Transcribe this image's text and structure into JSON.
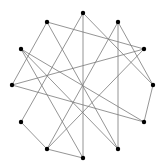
{
  "diagram": {
    "type": "graph",
    "width": 167,
    "height": 166,
    "colors": {
      "background": "#ffffff",
      "edge": "#7a7a7a",
      "node": "#000000"
    },
    "node_radius": 2.2,
    "nodes": [
      {
        "id": "A",
        "x": 83,
        "y": 13
      },
      {
        "id": "B",
        "x": 47,
        "y": 22
      },
      {
        "id": "C",
        "x": 118,
        "y": 22
      },
      {
        "id": "D",
        "x": 21,
        "y": 49
      },
      {
        "id": "E",
        "x": 144,
        "y": 49
      },
      {
        "id": "F",
        "x": 12,
        "y": 85
      },
      {
        "id": "G",
        "x": 153,
        "y": 85
      },
      {
        "id": "H",
        "x": 21,
        "y": 122
      },
      {
        "id": "I",
        "x": 144,
        "y": 122
      },
      {
        "id": "J",
        "x": 47,
        "y": 149
      },
      {
        "id": "K",
        "x": 118,
        "y": 149
      },
      {
        "id": "L",
        "x": 83,
        "y": 158
      }
    ],
    "edges": [
      [
        "A",
        "L"
      ],
      [
        "A",
        "H"
      ],
      [
        "A",
        "G"
      ],
      [
        "B",
        "E"
      ],
      [
        "B",
        "F"
      ],
      [
        "B",
        "K"
      ],
      [
        "C",
        "K"
      ],
      [
        "C",
        "G"
      ],
      [
        "C",
        "J"
      ],
      [
        "D",
        "I"
      ],
      [
        "D",
        "L"
      ],
      [
        "D",
        "K"
      ],
      [
        "E",
        "F"
      ],
      [
        "E",
        "J"
      ],
      [
        "F",
        "I"
      ],
      [
        "G",
        "I"
      ],
      [
        "H",
        "J"
      ],
      [
        "J",
        "L"
      ]
    ]
  }
}
